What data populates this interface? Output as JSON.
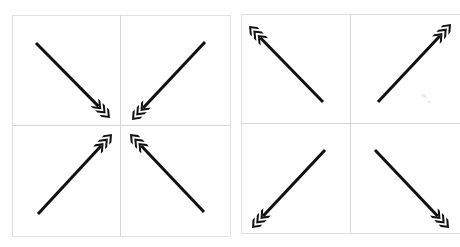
{
  "figure": {
    "title": "",
    "background": "#ffffff",
    "arrow_color": "#111111",
    "grid_color": "#d6d6d6",
    "chevrons_per_arrow": 3
  },
  "panels": [
    {
      "name": "converging",
      "label": "",
      "frame": {
        "x": 12,
        "y": 15,
        "w": 218,
        "h": 221
      },
      "center": {
        "x": 120,
        "y": 125
      },
      "direction": "inward",
      "arrows": [
        {
          "quadrant": "top-left",
          "tail": [
            36,
            43
          ],
          "head": [
            110,
            118
          ]
        },
        {
          "quadrant": "top-right",
          "tail": [
            205,
            42
          ],
          "head": [
            132,
            120
          ]
        },
        {
          "quadrant": "bottom-left",
          "tail": [
            38,
            214
          ],
          "head": [
            112,
            134
          ]
        },
        {
          "quadrant": "bottom-right",
          "tail": [
            204,
            212
          ],
          "head": [
            130,
            134
          ]
        }
      ]
    },
    {
      "name": "diverging",
      "label": "",
      "frame": {
        "x": 241,
        "y": 14,
        "w": 219,
        "h": 219
      },
      "center": {
        "x": 350,
        "y": 123
      },
      "direction": "outward",
      "arrows": [
        {
          "quadrant": "top-left",
          "tail": [
            323,
            102
          ],
          "head": [
            249,
            26
          ]
        },
        {
          "quadrant": "top-right",
          "tail": [
            378,
            102
          ],
          "head": [
            451,
            24
          ]
        },
        {
          "quadrant": "bottom-left",
          "tail": [
            325,
            150
          ],
          "head": [
            252,
            228
          ]
        },
        {
          "quadrant": "bottom-right",
          "tail": [
            375,
            150
          ],
          "head": [
            449,
            228
          ]
        }
      ]
    }
  ]
}
